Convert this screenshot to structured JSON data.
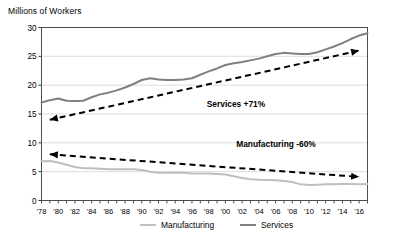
{
  "chart_data": {
    "type": "line",
    "title": "",
    "ylabel": "Millions of Workers",
    "xlabel": "",
    "ylim": [
      0,
      30
    ],
    "ytick_step": 5,
    "yticks": [
      "0",
      "5",
      "10",
      "15",
      "20",
      "25",
      "30"
    ],
    "grid": true,
    "legend_position": "bottom",
    "x": [
      1978,
      1979,
      1980,
      1981,
      1982,
      1983,
      1984,
      1985,
      1986,
      1987,
      1988,
      1989,
      1990,
      1991,
      1992,
      1993,
      1994,
      1995,
      1996,
      1997,
      1998,
      1999,
      2000,
      2001,
      2002,
      2003,
      2004,
      2005,
      2006,
      2007,
      2008,
      2009,
      2010,
      2011,
      2012,
      2013,
      2014,
      2015,
      2016,
      2017
    ],
    "xtick_labels": [
      "'78",
      "'80",
      "'82",
      "'84",
      "'86",
      "'88",
      "'90",
      "'92",
      "'94",
      "'96",
      "'98",
      "'00",
      "'02",
      "'04",
      "'06",
      "'08",
      "'10",
      "'12",
      "'14",
      "'16"
    ],
    "series": [
      {
        "name": "Manufacturing",
        "color": "#bfbfbf",
        "values": [
          6.8,
          6.85,
          6.6,
          6.2,
          5.8,
          5.6,
          5.6,
          5.5,
          5.4,
          5.4,
          5.4,
          5.4,
          5.3,
          5.0,
          4.8,
          4.8,
          4.85,
          4.8,
          4.7,
          4.7,
          4.7,
          4.6,
          4.5,
          4.2,
          3.9,
          3.7,
          3.6,
          3.55,
          3.5,
          3.4,
          3.2,
          2.8,
          2.7,
          2.75,
          2.8,
          2.8,
          2.85,
          2.85,
          2.8,
          2.85
        ]
      },
      {
        "name": "Services",
        "color": "#808080",
        "values": [
          17.0,
          17.4,
          17.7,
          17.3,
          17.25,
          17.3,
          17.9,
          18.4,
          18.7,
          19.1,
          19.6,
          20.2,
          20.9,
          21.2,
          21.0,
          20.9,
          20.9,
          21.0,
          21.2,
          21.8,
          22.4,
          22.9,
          23.5,
          23.8,
          24.0,
          24.3,
          24.6,
          25.0,
          25.4,
          25.6,
          25.5,
          25.4,
          25.4,
          25.7,
          26.2,
          26.7,
          27.3,
          28.0,
          28.6,
          29.0
        ]
      }
    ],
    "annotations": [
      {
        "label": "Services +71%",
        "start_value": 14.0,
        "end_value": 26.0,
        "style": "dashed-double-arrow"
      },
      {
        "label": "Manufacturing -60%",
        "start_value": 8.0,
        "end_value": 4.1,
        "style": "dashed-double-arrow"
      }
    ]
  },
  "legend": {
    "items": [
      {
        "label": "Manufacturing",
        "color": "#bfbfbf"
      },
      {
        "label": "Services",
        "color": "#808080"
      }
    ]
  }
}
